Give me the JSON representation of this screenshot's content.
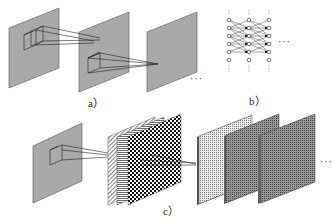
{
  "diagram": {
    "panel_a": {
      "label": "a）",
      "description": "Three gray feature planes with receptive field boxes projecting to next layer",
      "ellipsis": "···"
    },
    "panel_b": {
      "label": "b）",
      "description": "Fully connected network of nodes in three columns",
      "columns": 3,
      "nodes_per_column": 6,
      "ellipsis": "···"
    },
    "panel_c": {
      "label": "c）",
      "description": "Input plane with receptive field projecting to stacks of patterned feature maps",
      "stack_1_maps": [
        "diagonal-hatch",
        "horizontal-lines",
        "checkerboard"
      ],
      "stack_2_patterns": [
        "fine-dots",
        "dense-mesh",
        "dense-mesh"
      ],
      "ellipsis": "···"
    },
    "colors": {
      "plane_fill": "#a9a9a9",
      "line": "#222222",
      "background": "#ffffff"
    }
  }
}
